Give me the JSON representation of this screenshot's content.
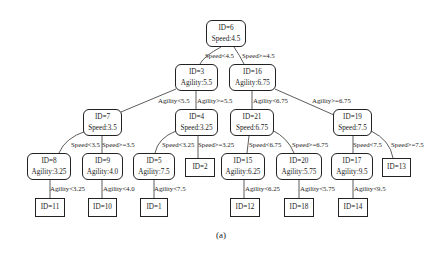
{
  "caption": "(a)",
  "nodes": {
    "n6": {
      "id": "ID=6",
      "attr": "Speed:4.5"
    },
    "n3": {
      "id": "ID=3",
      "attr": "Agility:5.5"
    },
    "n16": {
      "id": "ID=16",
      "attr": "Agility:6.75"
    },
    "n7": {
      "id": "ID=7",
      "attr": "Speed:3.5"
    },
    "n4": {
      "id": "ID=4",
      "attr": "Speed:3.25"
    },
    "n21": {
      "id": "ID=21",
      "attr": "Speed:6.75"
    },
    "n19": {
      "id": "ID=19",
      "attr": "Speed:7.5"
    },
    "n8": {
      "id": "ID=8",
      "attr": "Agility:3.25"
    },
    "n9": {
      "id": "ID=9",
      "attr": "Agility:4.0"
    },
    "n5": {
      "id": "ID=5",
      "attr": "Agility:7.5"
    },
    "n2": {
      "id": "ID=2"
    },
    "n15": {
      "id": "ID=15",
      "attr": "Agility:6.25"
    },
    "n20": {
      "id": "ID=20",
      "attr": "Agility:5.75"
    },
    "n17": {
      "id": "ID=17",
      "attr": "Agility:9.5"
    },
    "n13": {
      "id": "ID=13"
    },
    "n11": {
      "id": "ID=11"
    },
    "n10": {
      "id": "ID=10"
    },
    "n1": {
      "id": "ID=1"
    },
    "n12": {
      "id": "ID=12"
    },
    "n18": {
      "id": "ID=18"
    },
    "n14": {
      "id": "ID=14"
    }
  },
  "edges": {
    "e6_3": "Speed<4.5",
    "e6_16": "Speed>=4.5",
    "e3_7": "Agility<5.5",
    "e3_4": "Agility>=5.5",
    "e16_21": "Agility<6.75",
    "e16_19": "Agility>=6.75",
    "e7_8": "Speed<3.5",
    "e7_9": "Speed>=3.5",
    "e4_5": "Speed<3.25",
    "e4_2": "Speed>=3.25",
    "e21_15": "Speed<6.75",
    "e21_20": "Speed>=6.75",
    "e19_17": "Speed<7.5",
    "e19_13": "Speed>=7.5",
    "e8_11": "Agility<3.25",
    "e9_10": "Agility<4.0",
    "e5_1": "Agility<7.5",
    "e15_12": "Agility<6.25",
    "e20_18": "Agility<5.75",
    "e17_14": "Agility<9.5"
  }
}
